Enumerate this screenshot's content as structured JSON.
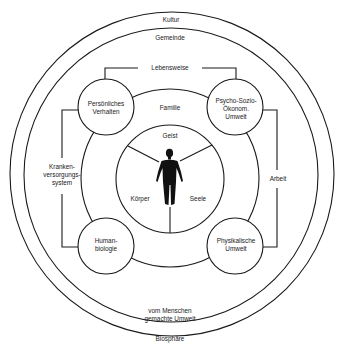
{
  "diagram": {
    "rings": {
      "outer": "Kultur",
      "second": "Gemeinde",
      "family": "Familie",
      "bottom_outer": "Biosphäre",
      "bottom_second_line1": "vom Menschen",
      "bottom_second_line2": "gemachte Umwelt"
    },
    "center": {
      "top": "Geist",
      "left": "Körper",
      "right": "Seele",
      "figure_icon": "human-silhouette"
    },
    "nodes": {
      "top_left": [
        "Persönliches",
        "Verhalten"
      ],
      "top_right": [
        "Psycho-Sozio-",
        "Ökonom.",
        "Umwelt"
      ],
      "bottom_left": [
        "Human-",
        "biologie"
      ],
      "bottom_right": [
        "Physikalische",
        "Umwelt"
      ]
    },
    "connectors": {
      "top": "Lebensweise",
      "left": [
        "Kranken-",
        "versorgungs-",
        "system"
      ],
      "right": "Arbeit"
    },
    "colors": {
      "line": "#1a1a1a",
      "background": "#ffffff"
    }
  }
}
